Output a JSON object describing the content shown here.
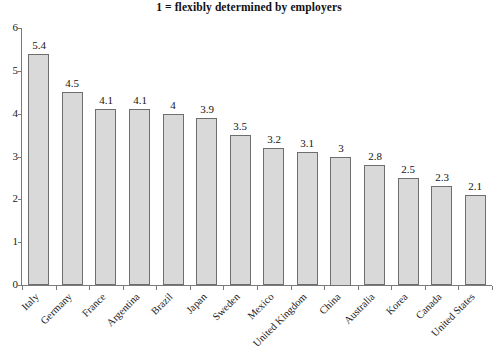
{
  "chart_data": {
    "type": "bar",
    "title": "1 = flexibly determined by employers",
    "xlabel": "",
    "ylabel": "",
    "ylim": [
      0,
      6
    ],
    "yticks": [
      0,
      1,
      2,
      3,
      4,
      5,
      6
    ],
    "ytick_labels": [
      "0",
      "1",
      "2",
      "3",
      "4",
      "5",
      "6"
    ],
    "grid": false,
    "legend": null,
    "bar_color": "#d9d9d9",
    "bar_edge_color": "#6e6e6e",
    "categories": [
      "Italy",
      "Germany",
      "France",
      "Argentina",
      "Brazil",
      "Japan",
      "Sweden",
      "Mexico",
      "United Kingdom",
      "China",
      "Australia",
      "Korea",
      "Canada",
      "United States"
    ],
    "values": [
      5.4,
      4.5,
      4.1,
      4.1,
      4,
      3.9,
      3.5,
      3.2,
      3.1,
      3,
      2.8,
      2.5,
      2.3,
      2.1
    ],
    "value_labels": [
      "5.4",
      "4.5",
      "4.1",
      "4.1",
      "4",
      "3.9",
      "3.5",
      "3.2",
      "3.1",
      "3",
      "2.8",
      "2.5",
      "2.3",
      "2.1"
    ]
  }
}
